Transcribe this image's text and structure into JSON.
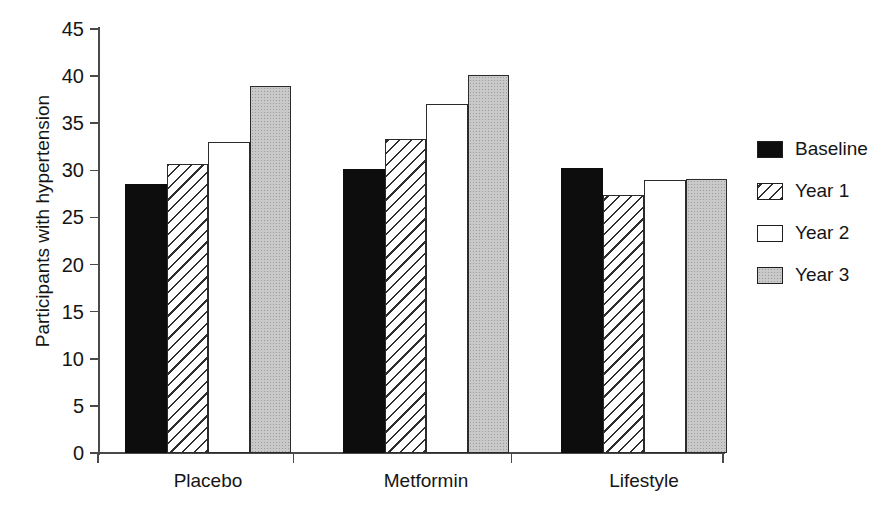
{
  "chart_data": {
    "type": "bar",
    "title": "",
    "xlabel": "",
    "ylabel": "Participants with hypertension",
    "ylim": [
      0,
      45
    ],
    "yticks": [
      0,
      5,
      10,
      15,
      20,
      25,
      30,
      35,
      40,
      45
    ],
    "grid": false,
    "legend_position": "right",
    "categories": [
      "Placebo",
      "Metformin",
      "Lifestyle"
    ],
    "series": [
      {
        "name": "Baseline",
        "pattern": "solid-black",
        "color": "#0d0d0d",
        "values": [
          28.5,
          30.1,
          30.2
        ]
      },
      {
        "name": "Year 1",
        "pattern": "diagonal-hatch",
        "color": "#ffffff",
        "values": [
          30.7,
          33.3,
          27.4
        ]
      },
      {
        "name": "Year 2",
        "pattern": "empty-white",
        "color": "#ffffff",
        "values": [
          33.0,
          37.0,
          29.0
        ]
      },
      {
        "name": "Year 3",
        "pattern": "gray-stipple",
        "color": "#c9c9c9",
        "values": [
          38.9,
          40.1,
          29.1
        ]
      }
    ]
  },
  "axis": {
    "y_title": "Participants with hypertension",
    "y_tick_labels": [
      "45",
      "40",
      "35",
      "30",
      "25",
      "20",
      "15",
      "10",
      "5",
      "0"
    ],
    "x_tick_labels": [
      "Placebo",
      "Metformin",
      "Lifestyle"
    ]
  },
  "legend": {
    "entries": [
      {
        "label": "Baseline",
        "swatch": "solid-black-swatch"
      },
      {
        "label": "Year 1",
        "swatch": "diagonal-hatch-swatch"
      },
      {
        "label": "Year 2",
        "swatch": "empty-white-swatch"
      },
      {
        "label": "Year 3",
        "swatch": "gray-stipple-swatch"
      }
    ]
  },
  "colors": {
    "baseline": "#0d0d0d",
    "year1": "#ffffff",
    "year2": "#ffffff",
    "year3": "#c9c9c9",
    "axis": "#4a4a4a",
    "text": "#151515",
    "background": "#ffffff"
  }
}
